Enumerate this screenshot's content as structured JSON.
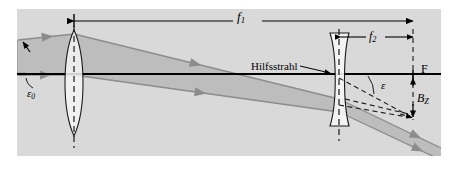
{
  "figure": {
    "kind": "optical-ray-diagram",
    "canvas": {
      "width": 458,
      "height": 173
    },
    "panel": {
      "x": 17,
      "y": 9,
      "width": 424,
      "height": 147,
      "fill": "#d9d9d9"
    }
  },
  "labels": {
    "f1": {
      "text": "f",
      "sub": "1"
    },
    "f2": {
      "text": "f",
      "sub": "2"
    },
    "hilfsstrahl": "Hilfsstrahl",
    "focal_point": "F",
    "epsilon": "ε",
    "epsilon_zero": {
      "text": "ε",
      "sub": "0"
    },
    "beam_size": {
      "text": "B",
      "sub": "Z"
    }
  },
  "colors": {
    "panel_background": "#d9d9d9",
    "beam_fill": "#b3b3b3",
    "ray_stroke": "#808080",
    "axis_stroke": "#000000",
    "lens_fill": "#f2f2f2",
    "page_background": "#ffffff"
  },
  "elements": {
    "converging_lens": {
      "center_x": 74,
      "top_y": 30,
      "bottom_y": 136,
      "type": "biconvex"
    },
    "diverging_lens": {
      "center_x": 339,
      "top_y": 33,
      "bottom_y": 126,
      "type": "biconcave"
    },
    "optical_axis_y": 74,
    "focal_dimension_f1": {
      "from_x": 74,
      "to_x": 413,
      "y": 21
    },
    "focal_dimension_f2": {
      "from_x": 339,
      "to_x": 413,
      "y": 37
    }
  }
}
